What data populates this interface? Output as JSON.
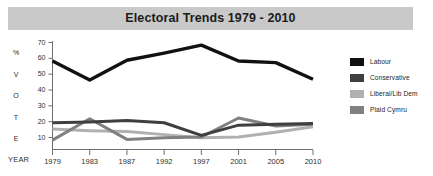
{
  "title": "Electoral Trends 1979 - 2010",
  "axis": {
    "y_caption_chars": [
      "%",
      "V",
      "O",
      "T",
      "E"
    ],
    "x_caption": "YEAR"
  },
  "legend": {
    "items": [
      {
        "label": "Labour",
        "color": "#111111"
      },
      {
        "label": "Conservative",
        "color": "#3f3f3f"
      },
      {
        "label": "Liberal/Lib Dem",
        "color": "#b0b0b0"
      },
      {
        "label": "Plaid Cymru",
        "color": "#808080"
      }
    ]
  },
  "colors": {
    "title_bar": "#c9c9c9",
    "axis": "#6e6e6e",
    "background": "#ffffff",
    "text": "#1d1d1d"
  },
  "chart_data": {
    "type": "line",
    "title": "Electoral Trends 1979 - 2010",
    "xlabel": "YEAR",
    "ylabel": "% VOTE",
    "categories": [
      "1979",
      "1983",
      "1987",
      "1992",
      "1997",
      "2001",
      "2005",
      "2010"
    ],
    "ylim": [
      0,
      70
    ],
    "yticks": [
      10,
      20,
      30,
      40,
      50,
      60,
      70
    ],
    "grid": false,
    "legend_position": "right",
    "series": [
      {
        "name": "Labour",
        "color": "#111111",
        "width": 3.4,
        "values": [
          58,
          46,
          58.5,
          63,
          68,
          58,
          57,
          46.5
        ]
      },
      {
        "name": "Conservative",
        "color": "#3f3f3f",
        "width": 3.0,
        "values": [
          19,
          19.5,
          20.5,
          19,
          11,
          17.5,
          18,
          18.5
        ]
      },
      {
        "name": "Liberal/Lib Dem",
        "color": "#b0b0b0",
        "width": 3.0,
        "values": [
          15,
          14,
          13.5,
          11.5,
          9.5,
          10,
          13,
          16.5
        ]
      },
      {
        "name": "Plaid Cymru",
        "color": "#808080",
        "width": 3.0,
        "values": [
          8,
          21.5,
          8.5,
          9.5,
          10,
          22,
          17,
          18
        ]
      }
    ]
  }
}
